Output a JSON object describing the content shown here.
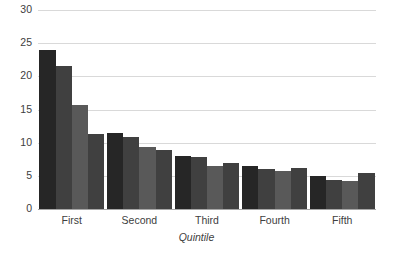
{
  "chart_data": {
    "type": "bar",
    "title": "",
    "subtitle": "",
    "xlabel": "Quintile",
    "ylabel": "",
    "categories": [
      "First",
      "Second",
      "Third",
      "Fourth",
      "Fifth"
    ],
    "series": [
      {
        "name": "Series 1",
        "color": "#262626",
        "values": [
          24.0,
          11.5,
          8.0,
          6.5,
          5.0
        ]
      },
      {
        "name": "Series 2",
        "color": "#404040",
        "values": [
          21.5,
          10.8,
          7.9,
          6.0,
          4.4
        ]
      },
      {
        "name": "Series 3",
        "color": "#595959",
        "values": [
          15.7,
          9.3,
          6.5,
          5.7,
          4.2
        ]
      },
      {
        "name": "Series 4",
        "color": "#404040",
        "values": [
          11.3,
          8.9,
          6.9,
          6.2,
          5.5
        ]
      }
    ],
    "ylim": [
      0,
      30
    ],
    "yticks": [
      0,
      5,
      10,
      15,
      20,
      25,
      30
    ],
    "ytick_labels": [
      "0",
      "5",
      "10",
      "15",
      "20",
      "25",
      "30"
    ],
    "grid": true,
    "grid_axis": "y",
    "grid_color": "#d9d9d9",
    "legend": false,
    "legend_position": "none",
    "background": "#ffffff",
    "axis_color": "#a6a6a6",
    "text_color": "#404040"
  }
}
